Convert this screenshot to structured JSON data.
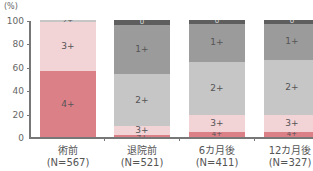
{
  "chart_data": {
    "type": "bar",
    "stacked": true,
    "title": "",
    "ylabel": "(%)",
    "xlabel": "",
    "ylim": [
      0,
      100
    ],
    "yticks": [
      "0",
      "20",
      "40",
      "60",
      "80",
      "100"
    ],
    "grid": false,
    "legend_position": "inline-segment-labels",
    "categories": [
      "術前",
      "退院前",
      "6カ月後",
      "12カ月後"
    ],
    "category_n": [
      "(N=567)",
      "(N=521)",
      "(N=411)",
      "(N=327)"
    ],
    "series": [
      {
        "name": "4+",
        "color": "#dc8088",
        "values": [
          56,
          2,
          4,
          4
        ]
      },
      {
        "name": "3+",
        "color": "#f2d3d6",
        "values": [
          42,
          7,
          15,
          15
        ]
      },
      {
        "name": "2+",
        "color": "#c6c6c6",
        "values": [
          2,
          45,
          45,
          47
        ]
      },
      {
        "name": "1+",
        "color": "#9b9b9b",
        "values": [
          0,
          42,
          33,
          31
        ]
      },
      {
        "name": "0",
        "color": "#5e5e5e",
        "values": [
          0,
          4,
          3,
          3
        ]
      }
    ]
  },
  "labels": {
    "unit": "(%)",
    "yticks": [
      "100",
      "80",
      "60",
      "40",
      "20",
      "0"
    ],
    "bars": [
      {
        "name": "術前",
        "n": "(N=567)"
      },
      {
        "name": "退院前",
        "n": "(N=521)"
      },
      {
        "name": "6カ月後",
        "n": "(N=411)"
      },
      {
        "name": "12カ月後",
        "n": "(N=327)"
      }
    ]
  }
}
